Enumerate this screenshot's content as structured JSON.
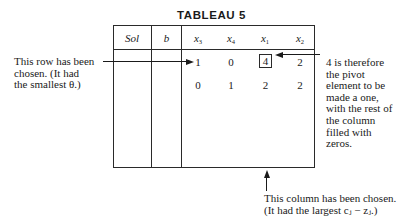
{
  "title": "TABLEAU 5",
  "table": {
    "headers": {
      "sol": "Sol",
      "b": "b",
      "vars": [
        {
          "base": "x",
          "sub": "3"
        },
        {
          "base": "x",
          "sub": "4"
        },
        {
          "base": "x",
          "sub": "1"
        },
        {
          "base": "x",
          "sub": "2"
        }
      ]
    },
    "rows": [
      {
        "sol": "",
        "b": "",
        "values": [
          "1",
          "0",
          "4",
          "2"
        ]
      },
      {
        "sol": "",
        "b": "",
        "values": [
          "0",
          "1",
          "2",
          "2"
        ]
      }
    ],
    "pivot": {
      "row": 0,
      "col": 2,
      "value": "4"
    }
  },
  "annotations": {
    "row_note": {
      "line1": "This row has been",
      "line2": "chosen. (It had",
      "line3": "the smallest θ.)"
    },
    "pivot_note": {
      "line1": "4 is therefore",
      "line2": "the pivot",
      "line3": "element to be",
      "line4": "made a one,",
      "line5": "with the rest of",
      "line6": "the column",
      "line7": "filled with",
      "line8": "zeros."
    },
    "column_note": {
      "line1": "This column has been chosen.",
      "line2": "(It had the largest cⱼ − zⱼ.)"
    }
  }
}
